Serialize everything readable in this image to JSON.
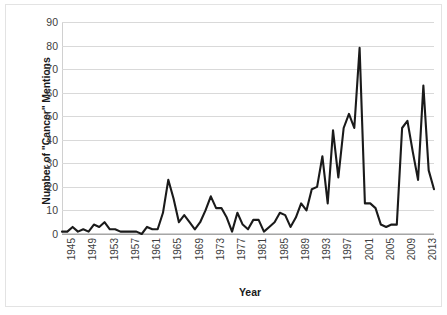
{
  "chart_data": {
    "type": "line",
    "title": "",
    "xlabel": "Year",
    "ylabel": "Number of \"Cancer\" Mentions",
    "xlim": [
      1945,
      2015
    ],
    "ylim": [
      0,
      90
    ],
    "ytick_step": 10,
    "xtick_step": 4,
    "grid": "horizontal",
    "legend": "none",
    "line_color": "#1a1a1a",
    "grid_color": "#d9d9d9",
    "yticks": [
      0,
      10,
      20,
      30,
      40,
      50,
      60,
      70,
      80,
      90
    ],
    "xticks": [
      1945,
      1949,
      1953,
      1957,
      1961,
      1965,
      1969,
      1973,
      1977,
      1981,
      1985,
      1989,
      1993,
      1997,
      2001,
      2005,
      2009,
      2013
    ],
    "x": [
      1945,
      1946,
      1947,
      1948,
      1949,
      1950,
      1951,
      1952,
      1953,
      1954,
      1955,
      1956,
      1957,
      1958,
      1959,
      1960,
      1961,
      1962,
      1963,
      1964,
      1965,
      1966,
      1967,
      1968,
      1969,
      1970,
      1971,
      1972,
      1973,
      1974,
      1975,
      1976,
      1977,
      1978,
      1979,
      1980,
      1981,
      1982,
      1983,
      1984,
      1985,
      1986,
      1987,
      1988,
      1989,
      1990,
      1991,
      1992,
      1993,
      1994,
      1995,
      1996,
      1997,
      1998,
      1999,
      2000,
      2001,
      2002,
      2003,
      2004,
      2005,
      2006,
      2007,
      2008,
      2009,
      2010,
      2011,
      2012,
      2013,
      2014,
      2015
    ],
    "values": [
      1,
      1,
      3,
      1,
      2,
      1,
      4,
      3,
      5,
      2,
      2,
      1,
      1,
      1,
      1,
      0,
      3,
      2,
      2,
      9,
      23,
      15,
      5,
      8,
      5,
      2,
      5,
      10,
      16,
      11,
      11,
      7,
      1,
      9,
      4,
      2,
      6,
      6,
      1,
      3,
      5,
      9,
      8,
      3,
      7,
      13,
      10,
      19,
      20,
      33,
      13,
      44,
      24,
      45,
      51,
      45,
      79,
      13,
      13,
      11,
      4,
      3,
      4,
      4,
      45,
      48,
      35,
      23,
      63,
      27,
      19
    ],
    "series_name": "Cancer mentions per year"
  },
  "axes": {
    "ylabel": "Number of \"Cancer\" Mentions",
    "xlabel": "Year"
  }
}
